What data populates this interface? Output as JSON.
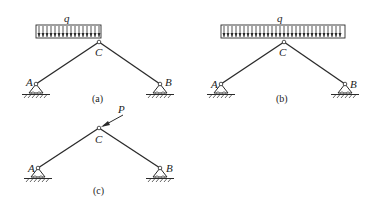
{
  "figures": [
    {
      "id": "a",
      "caption": "(a)",
      "load_label": "q",
      "load_type": "distributed",
      "load_extent": "left-half",
      "joint_labels": {
        "left_support": "A",
        "apex": "C",
        "right_support": "B"
      }
    },
    {
      "id": "b",
      "caption": "(b)",
      "load_label": "q",
      "load_type": "distributed",
      "load_extent": "full-span",
      "joint_labels": {
        "left_support": "A",
        "apex": "C",
        "right_support": "B"
      }
    },
    {
      "id": "c",
      "caption": "(c)",
      "load_label": "P",
      "load_type": "concentrated",
      "load_direction": "inclined-toward-C",
      "joint_labels": {
        "left_support": "A",
        "apex": "C",
        "right_support": "B"
      }
    }
  ],
  "colors": {
    "line": "#2a2a2a",
    "background": "#ffffff"
  }
}
